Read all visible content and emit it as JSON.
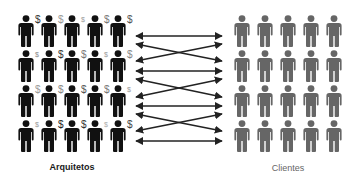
{
  "diagram": {
    "type": "relationship-network",
    "groups": {
      "architects": {
        "label": "Arquitetos",
        "color": "#111111",
        "rows": 4,
        "cols": 5,
        "col_x": [
          26,
          49,
          72,
          95,
          118
        ],
        "row_y": [
          15,
          50,
          85,
          120
        ],
        "dollar_signs": [
          [
            {
              "size": "large",
              "color": "#333333"
            },
            {
              "size": "large",
              "color": "#999999"
            },
            {
              "size": "small",
              "color": "#999999"
            },
            {
              "size": "large",
              "color": "#777777"
            },
            {
              "size": "large",
              "color": "#555555"
            }
          ],
          [
            {
              "size": "small",
              "color": "#888888"
            },
            {
              "size": "large",
              "color": "#333333"
            },
            {
              "size": "large",
              "color": "#777777"
            },
            {
              "size": "small",
              "color": "#999999"
            },
            {
              "size": "large",
              "color": "#888888"
            }
          ],
          [
            {
              "size": "large",
              "color": "#999999"
            },
            {
              "size": "large",
              "color": "#888888"
            },
            {
              "size": "large",
              "color": "#555555"
            },
            {
              "size": "large",
              "color": "#777777"
            },
            {
              "size": "small",
              "color": "#999999"
            }
          ],
          [
            {
              "size": "small",
              "color": "#999999"
            },
            {
              "size": "large",
              "color": "#222222"
            },
            {
              "size": "large",
              "color": "#333333"
            },
            {
              "size": "small",
              "color": "#aaaaaa"
            },
            {
              "size": "large",
              "color": "#444444"
            }
          ]
        ]
      },
      "clients": {
        "label": "Clientes",
        "color": "#666666",
        "rows": 4,
        "cols": 5,
        "col_x": [
          242,
          265,
          288,
          311,
          334
        ],
        "row_y": [
          15,
          50,
          85,
          120
        ]
      }
    },
    "arrows": {
      "color": "#222222",
      "x_left": 136,
      "x_right": 222,
      "lines": [
        {
          "y1": 36,
          "y2": 36
        },
        {
          "y1": 44,
          "y2": 61
        },
        {
          "y1": 61,
          "y2": 44
        },
        {
          "y1": 71,
          "y2": 71
        },
        {
          "y1": 79,
          "y2": 97
        },
        {
          "y1": 97,
          "y2": 79
        },
        {
          "y1": 106,
          "y2": 106
        },
        {
          "y1": 114,
          "y2": 131
        },
        {
          "y1": 131,
          "y2": 114
        },
        {
          "y1": 141,
          "y2": 141
        }
      ]
    },
    "icons": {
      "person": "person-icon",
      "dollar": "dollar-sign-icon",
      "dollar_glyph": "$"
    }
  }
}
